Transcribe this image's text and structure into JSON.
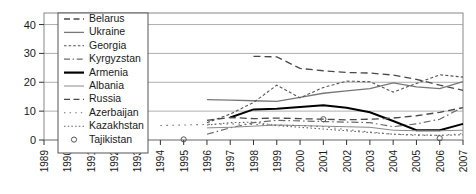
{
  "chart_data": {
    "type": "line",
    "title": "",
    "xlabel": "",
    "ylabel": "",
    "xlim": [
      1989,
      2007
    ],
    "ylim": [
      0,
      44
    ],
    "grid": true,
    "legend_position": "top-left-inside",
    "x_ticks": [
      "1989",
      "1990",
      "1991",
      "1992",
      "1993",
      "1994",
      "1995",
      "1996",
      "1997",
      "1998",
      "1999",
      "2000",
      "2001",
      "2002",
      "2003",
      "2004",
      "2005",
      "2006",
      "2007"
    ],
    "y_ticks": [
      "0",
      "10",
      "20",
      "30",
      "40"
    ],
    "series": [
      {
        "name": "Belarus",
        "style": "dashed",
        "color": "#4a4a4a",
        "width": 1.3,
        "x": [
          1998,
          1999,
          2000,
          2001,
          2002,
          2003,
          2004,
          2005,
          2006,
          2007
        ],
        "values": [
          29.0,
          28.8,
          24.8,
          24.0,
          23.4,
          23.2,
          22.5,
          21.0,
          19.0,
          17.2
        ]
      },
      {
        "name": "Ukraine",
        "style": "solid",
        "color": "#777777",
        "width": 1.3,
        "x": [
          1996,
          1997,
          1998,
          1999,
          2000,
          2001,
          2002,
          2003,
          2004,
          2005,
          2006,
          2007
        ],
        "values": [
          14.0,
          13.8,
          13.6,
          13.4,
          14.8,
          16.2,
          17.0,
          17.8,
          19.8,
          18.4,
          17.8,
          20.2
        ]
      },
      {
        "name": "Georgia",
        "style": "dotted",
        "color": "#555555",
        "width": 1.1,
        "x": [
          1996,
          1997,
          1998,
          1999,
          2000,
          2001,
          2002,
          2003,
          2004,
          2005,
          2006,
          2007
        ],
        "values": [
          6.0,
          9.0,
          13.0,
          19.0,
          14.6,
          18.2,
          20.4,
          20.2,
          16.6,
          19.6,
          22.6,
          21.8
        ]
      },
      {
        "name": "Kyrgyzstan",
        "style": "dashdot",
        "color": "#6a6a6a",
        "width": 1.2,
        "x": [
          1996,
          1997,
          1998,
          1999,
          2000,
          2001,
          2002,
          2003,
          2004,
          2005,
          2006,
          2007
        ],
        "values": [
          2.0,
          4.2,
          6.0,
          6.8,
          6.6,
          6.4,
          6.2,
          6.0,
          4.6,
          5.6,
          7.2,
          11.4
        ]
      },
      {
        "name": "Armenia",
        "style": "solid",
        "color": "#000000",
        "width": 2.0,
        "x": [
          1997,
          1998,
          1999,
          2000,
          2001,
          2002,
          2003,
          2004,
          2005,
          2006,
          2007
        ],
        "values": [
          7.8,
          10.6,
          10.8,
          11.4,
          12.0,
          11.2,
          9.6,
          6.6,
          3.4,
          3.4,
          5.6
        ]
      },
      {
        "name": "Albania",
        "style": "solid",
        "color": "#8a8a8a",
        "width": 1.0,
        "x": [
          1996,
          1997,
          1998,
          1999,
          2000,
          2001,
          2002,
          2003,
          2004,
          2005,
          2006,
          2007
        ],
        "values": [
          4.2,
          4.4,
          4.8,
          5.2,
          5.0,
          4.8,
          4.6,
          4.4,
          3.4,
          3.2,
          3.2,
          3.4
        ]
      },
      {
        "name": "Russia",
        "style": "dashed",
        "color": "#4a4a4a",
        "width": 1.3,
        "x": [
          1996,
          1997,
          1998,
          1999,
          2000,
          2001,
          2002,
          2003,
          2004,
          2005,
          2006,
          2007
        ],
        "values": [
          6.8,
          7.8,
          7.4,
          7.6,
          7.4,
          7.2,
          7.0,
          7.2,
          7.6,
          8.4,
          9.6,
          11.2
        ]
      },
      {
        "name": "Azerbaijan",
        "style": "sparse-dotted",
        "color": "#707070",
        "width": 1.1,
        "x": [
          1994,
          1995,
          1996,
          1997,
          1998,
          1999,
          2000,
          2001,
          2002,
          2003,
          2004,
          2005,
          2006,
          2007
        ],
        "values": [
          5.0,
          5.2,
          5.4,
          5.6,
          5.4,
          5.2,
          5.0,
          4.6,
          3.6,
          2.8,
          2.0,
          1.6,
          1.6,
          2.2
        ]
      },
      {
        "name": "Kazakhstan",
        "style": "fine-dotted",
        "color": "#666666",
        "width": 1.1,
        "x": [
          1996,
          1997,
          1998,
          1999,
          2000,
          2001,
          2002,
          2003,
          2004,
          2005,
          2006,
          2007
        ],
        "values": [
          5.2,
          6.0,
          6.2,
          5.0,
          4.4,
          3.8,
          3.2,
          2.6,
          2.0,
          1.8,
          1.6,
          1.8
        ]
      },
      {
        "name": "Tajikistan",
        "style": "marker-circle",
        "color": "#555555",
        "width": 1.0,
        "x": [
          1995,
          2001,
          2006
        ],
        "values": [
          0.2,
          7.2,
          0.6
        ]
      }
    ]
  },
  "legend": {
    "items": [
      {
        "label": "Belarus",
        "swatch": "dashed"
      },
      {
        "label": "Ukraine",
        "swatch": "solid-gray"
      },
      {
        "label": "Georgia",
        "swatch": "dotted"
      },
      {
        "label": "Kyrgyzstan",
        "swatch": "dashdot"
      },
      {
        "label": "Armenia",
        "swatch": "solid-thick"
      },
      {
        "label": "Albania",
        "swatch": "solid-thin"
      },
      {
        "label": "Russia",
        "swatch": "dashed"
      },
      {
        "label": "Azerbaijan",
        "swatch": "sparse-dotted"
      },
      {
        "label": "Kazakhstan",
        "swatch": "fine-dotted"
      },
      {
        "label": "Tajikistan",
        "swatch": "circle"
      }
    ]
  }
}
